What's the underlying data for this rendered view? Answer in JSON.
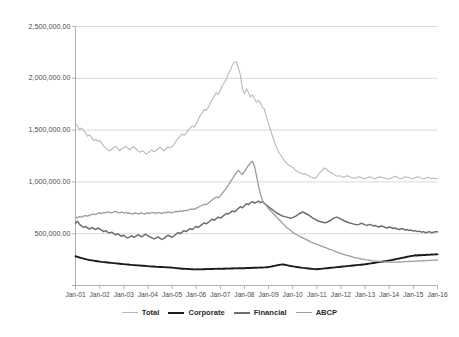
{
  "chart_data": {
    "type": "line",
    "title": "",
    "xlabel": "",
    "ylabel": "",
    "ylim": [
      0,
      2500000
    ],
    "grid": true,
    "legend_position": "bottom",
    "y_ticks": [
      0,
      500000,
      1000000,
      1500000,
      2000000,
      2500000
    ],
    "y_tick_labels": [
      "0.00",
      "500,000.00",
      "1,000,000.00",
      "1,500,000.00",
      "2,000,000.00",
      "2,500,000.00"
    ],
    "y_tick_labels_visible": [
      "500,000.00",
      "1,000,000.00",
      "1,500,000.00",
      "2,000,000.00",
      "2,500,000.00"
    ],
    "x_tick_labels": [
      "Jan-01",
      "Jan-02",
      "Jan-03",
      "Jan-04",
      "Jan-05",
      "Jan-06",
      "Jan-07",
      "Jan-08",
      "Jan-09",
      "Jan-10",
      "Jan-11",
      "Jan-12",
      "Jan-13",
      "Jan-14",
      "Jan-15",
      "Jan-16"
    ],
    "x_range": [
      "Jan-01",
      "Jan-16"
    ],
    "colors": {
      "total": "#b9b9b9",
      "corporate": "#1c1c1c",
      "financial": "#6e6e6e",
      "abcp": "#9c9c9c",
      "gridline": "#d9d9d9",
      "axis": "#b0b0b0",
      "background": "#ffffff"
    },
    "series": [
      {
        "name": "Total",
        "color": "#b9b9b9",
        "width": 1.1,
        "values": [
          1560000,
          1540000,
          1505000,
          1520000,
          1500000,
          1470000,
          1440000,
          1455000,
          1430000,
          1400000,
          1410000,
          1395000,
          1400000,
          1375000,
          1345000,
          1330000,
          1310000,
          1300000,
          1315000,
          1330000,
          1345000,
          1320000,
          1300000,
          1320000,
          1330000,
          1345000,
          1325000,
          1310000,
          1330000,
          1340000,
          1320000,
          1300000,
          1285000,
          1300000,
          1290000,
          1270000,
          1280000,
          1295000,
          1310000,
          1290000,
          1300000,
          1320000,
          1335000,
          1315000,
          1300000,
          1320000,
          1340000,
          1330000,
          1340000,
          1360000,
          1395000,
          1420000,
          1440000,
          1460000,
          1450000,
          1470000,
          1495000,
          1520000,
          1540000,
          1530000,
          1560000,
          1600000,
          1640000,
          1665000,
          1700000,
          1690000,
          1720000,
          1760000,
          1800000,
          1830000,
          1860000,
          1845000,
          1880000,
          1930000,
          1960000,
          1990000,
          2040000,
          2080000,
          2130000,
          2155000,
          2160000,
          2100000,
          2030000,
          1900000,
          1850000,
          1900000,
          1860000,
          1820000,
          1840000,
          1800000,
          1770000,
          1790000,
          1760000,
          1720000,
          1700000,
          1620000,
          1560000,
          1500000,
          1440000,
          1380000,
          1330000,
          1290000,
          1260000,
          1230000,
          1200000,
          1180000,
          1160000,
          1150000,
          1140000,
          1120000,
          1105000,
          1095000,
          1085000,
          1075000,
          1080000,
          1070000,
          1060000,
          1045000,
          1040000,
          1035000,
          1050000,
          1080000,
          1100000,
          1120000,
          1135000,
          1120000,
          1100000,
          1090000,
          1080000,
          1065000,
          1055000,
          1060000,
          1055000,
          1045000,
          1050000,
          1060000,
          1055000,
          1045000,
          1040000,
          1035000,
          1045000,
          1050000,
          1045000,
          1035000,
          1030000,
          1040000,
          1050000,
          1045000,
          1035000,
          1030000,
          1040000,
          1050000,
          1045000,
          1040000,
          1035000,
          1030000,
          1025000,
          1035000,
          1045000,
          1055000,
          1045000,
          1035000,
          1030000,
          1040000,
          1050000,
          1045000,
          1040000,
          1035000,
          1030000,
          1040000,
          1050000,
          1045000,
          1035000,
          1030000,
          1035000,
          1045000,
          1040000,
          1030000,
          1035000,
          1030000,
          1035000
        ]
      },
      {
        "name": "Corporate",
        "color": "#1c1c1c",
        "width": 1.9,
        "values": [
          282000,
          276000,
          270000,
          265000,
          260000,
          255000,
          250000,
          246000,
          243000,
          240000,
          237000,
          234000,
          231000,
          228000,
          226000,
          224000,
          222000,
          220000,
          218000,
          216000,
          214000,
          212000,
          210000,
          208000,
          206000,
          204000,
          202000,
          200000,
          199000,
          197000,
          196000,
          194000,
          193000,
          191000,
          190000,
          188000,
          187000,
          185000,
          184000,
          183000,
          181000,
          180000,
          179000,
          178000,
          177000,
          176000,
          175000,
          174000,
          172000,
          170000,
          168000,
          166000,
          164000,
          162000,
          161000,
          160000,
          159000,
          158000,
          157000,
          156000,
          156000,
          157000,
          156000,
          158000,
          157000,
          159000,
          158000,
          160000,
          159000,
          161000,
          160000,
          162000,
          161000,
          163000,
          162000,
          164000,
          163000,
          165000,
          164000,
          166000,
          165000,
          167000,
          166000,
          168000,
          167000,
          169000,
          170000,
          169000,
          171000,
          172000,
          171000,
          173000,
          174000,
          173000,
          175000,
          176000,
          178000,
          182000,
          186000,
          190000,
          194000,
          198000,
          201000,
          204000,
          200000,
          196000,
          192000,
          188000,
          185000,
          182000,
          179000,
          176000,
          173000,
          170000,
          168000,
          166000,
          164000,
          162000,
          160000,
          158000,
          157000,
          159000,
          161000,
          163000,
          165000,
          167000,
          169000,
          171000,
          173000,
          175000,
          177000,
          179000,
          181000,
          183000,
          185000,
          187000,
          189000,
          191000,
          193000,
          195000,
          197000,
          199000,
          201000,
          203000,
          205000,
          208000,
          211000,
          214000,
          217000,
          220000,
          223000,
          226000,
          229000,
          232000,
          235000,
          238000,
          241000,
          245000,
          249000,
          253000,
          257000,
          261000,
          265000,
          269000,
          273000,
          277000,
          281000,
          285000,
          288000,
          292000,
          290000,
          294000,
          292000,
          296000,
          294000,
          298000,
          296000,
          300000,
          298000,
          302000,
          300000
        ]
      },
      {
        "name": "Financial",
        "color": "#6e6e6e",
        "width": 1.5,
        "values": [
          600000,
          620000,
          590000,
          575000,
          560000,
          570000,
          555000,
          545000,
          560000,
          550000,
          540000,
          555000,
          545000,
          535000,
          520000,
          530000,
          515000,
          505000,
          515000,
          500000,
          490000,
          500000,
          485000,
          475000,
          485000,
          470000,
          460000,
          470000,
          480000,
          465000,
          475000,
          490000,
          480000,
          470000,
          485000,
          495000,
          480000,
          470000,
          460000,
          450000,
          460000,
          470000,
          455000,
          445000,
          455000,
          470000,
          485000,
          475000,
          465000,
          480000,
          495000,
          510000,
          500000,
          515000,
          530000,
          520000,
          535000,
          550000,
          540000,
          555000,
          570000,
          560000,
          575000,
          590000,
          605000,
          595000,
          610000,
          625000,
          640000,
          630000,
          645000,
          660000,
          650000,
          665000,
          680000,
          695000,
          690000,
          705000,
          720000,
          710000,
          725000,
          745000,
          760000,
          750000,
          770000,
          790000,
          780000,
          800000,
          810000,
          795000,
          805000,
          815000,
          800000,
          810000,
          790000,
          775000,
          760000,
          745000,
          730000,
          715000,
          700000,
          690000,
          680000,
          670000,
          665000,
          660000,
          655000,
          650000,
          655000,
          665000,
          675000,
          690000,
          700000,
          710000,
          700000,
          690000,
          680000,
          665000,
          650000,
          640000,
          630000,
          620000,
          615000,
          610000,
          605000,
          610000,
          620000,
          630000,
          645000,
          655000,
          660000,
          650000,
          640000,
          630000,
          620000,
          615000,
          605000,
          600000,
          595000,
          590000,
          585000,
          590000,
          600000,
          595000,
          585000,
          580000,
          590000,
          585000,
          575000,
          580000,
          570000,
          565000,
          575000,
          570000,
          560000,
          555000,
          565000,
          560000,
          550000,
          555000,
          545000,
          540000,
          550000,
          545000,
          535000,
          540000,
          530000,
          535000,
          525000,
          530000,
          520000,
          525000,
          515000,
          520000,
          510000,
          515000,
          520000,
          510000,
          515000,
          520000,
          518000
        ]
      },
      {
        "name": "ABCP",
        "color": "#9c9c9c",
        "width": 1.3,
        "values": [
          660000,
          655000,
          665000,
          660000,
          670000,
          675000,
          670000,
          680000,
          685000,
          690000,
          685000,
          695000,
          700000,
          695000,
          705000,
          700000,
          710000,
          705000,
          700000,
          710000,
          715000,
          705000,
          700000,
          710000,
          700000,
          705000,
          695000,
          700000,
          690000,
          695000,
          700000,
          690000,
          695000,
          700000,
          690000,
          695000,
          700000,
          695000,
          705000,
          700000,
          695000,
          705000,
          700000,
          695000,
          705000,
          700000,
          710000,
          705000,
          700000,
          710000,
          715000,
          710000,
          720000,
          715000,
          725000,
          720000,
          730000,
          735000,
          740000,
          735000,
          745000,
          755000,
          765000,
          775000,
          785000,
          780000,
          795000,
          810000,
          825000,
          840000,
          855000,
          845000,
          865000,
          890000,
          915000,
          940000,
          970000,
          1000000,
          1030000,
          1060000,
          1090000,
          1110000,
          1090000,
          1070000,
          1100000,
          1130000,
          1160000,
          1185000,
          1200000,
          1150000,
          1060000,
          960000,
          880000,
          820000,
          790000,
          770000,
          740000,
          720000,
          700000,
          680000,
          660000,
          640000,
          620000,
          600000,
          580000,
          560000,
          545000,
          530000,
          515000,
          500000,
          490000,
          480000,
          470000,
          460000,
          450000,
          440000,
          430000,
          420000,
          412000,
          405000,
          398000,
          390000,
          382000,
          375000,
          368000,
          360000,
          352000,
          345000,
          338000,
          330000,
          322000,
          315000,
          308000,
          302000,
          296000,
          290000,
          285000,
          280000,
          275000,
          270000,
          266000,
          262000,
          258000,
          254000,
          250000,
          247000,
          244000,
          241000,
          238000,
          236000,
          234000,
          232000,
          230000,
          229000,
          228000,
          227000,
          226000,
          226000,
          225000,
          225000,
          226000,
          227000,
          228000,
          229000,
          230000,
          231000,
          232000,
          233000,
          234000,
          235000,
          236000,
          237000,
          238000,
          239000,
          240000,
          241000,
          242000,
          243000,
          244000,
          245000,
          246000
        ]
      }
    ]
  },
  "legend": {
    "items": [
      {
        "label": "Total",
        "color": "#b9b9b9",
        "thickness": "1.6px"
      },
      {
        "label": "Corporate",
        "color": "#1c1c1c",
        "thickness": "2.6px"
      },
      {
        "label": "Financial",
        "color": "#6e6e6e",
        "thickness": "2.2px"
      },
      {
        "label": "ABCP",
        "color": "#9c9c9c",
        "thickness": "1.8px"
      }
    ]
  }
}
